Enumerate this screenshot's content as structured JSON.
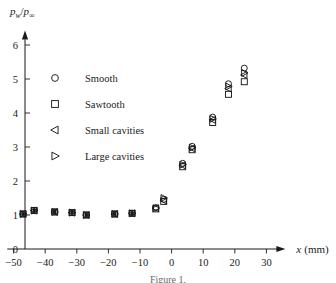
{
  "figure": {
    "caption_fragment": "Figure 1."
  },
  "chart_data": {
    "type": "scatter",
    "title": "",
    "xlabel": "x (mm)",
    "xlabel_symbol": "x",
    "xlabel_unit": "(mm)",
    "ylabel": "pw/p∞",
    "ylabel_symbol": "p",
    "ylabel_sub": "w",
    "ylabel_denom_symbol": "p",
    "ylabel_denom_sub": "∞",
    "xlim": [
      -52,
      36
    ],
    "ylim": [
      0,
      6.4
    ],
    "xticks": [
      -50,
      -40,
      -30,
      -20,
      -10,
      0,
      10,
      20,
      30
    ],
    "xticklabels": [
      "-50",
      "-40",
      "-30",
      "-20",
      "-10",
      "0",
      "10",
      "20",
      "30"
    ],
    "yticks": [
      0,
      1,
      2,
      3,
      4,
      5,
      6
    ],
    "yticklabels": [
      "0",
      "1",
      "2",
      "3",
      "4",
      "5",
      "6"
    ],
    "grid": false,
    "legend_position": "upper-left-inside",
    "series": [
      {
        "name": "Smooth",
        "marker": "circle",
        "points": [
          {
            "x": -47.0,
            "y": 1.03
          },
          {
            "x": -43.5,
            "y": 1.14
          },
          {
            "x": -37.0,
            "y": 1.09
          },
          {
            "x": -31.5,
            "y": 1.07
          },
          {
            "x": -27.0,
            "y": 1.0
          },
          {
            "x": -18.0,
            "y": 1.03
          },
          {
            "x": -12.5,
            "y": 1.05
          },
          {
            "x": -5.0,
            "y": 1.22
          },
          {
            "x": -2.5,
            "y": 1.46
          },
          {
            "x": 3.5,
            "y": 2.52
          },
          {
            "x": 6.5,
            "y": 3.02
          },
          {
            "x": 13.0,
            "y": 3.88
          },
          {
            "x": 18.0,
            "y": 4.86
          },
          {
            "x": 23.0,
            "y": 5.32
          }
        ]
      },
      {
        "name": "Sawtooth",
        "marker": "square",
        "points": [
          {
            "x": -47.0,
            "y": 1.03
          },
          {
            "x": -43.5,
            "y": 1.13
          },
          {
            "x": -37.0,
            "y": 1.09
          },
          {
            "x": -31.5,
            "y": 1.07
          },
          {
            "x": -27.0,
            "y": 1.0
          },
          {
            "x": -18.0,
            "y": 1.03
          },
          {
            "x": -12.5,
            "y": 1.05
          },
          {
            "x": -5.0,
            "y": 1.18
          },
          {
            "x": -2.5,
            "y": 1.4
          },
          {
            "x": 3.5,
            "y": 2.42
          },
          {
            "x": 6.5,
            "y": 2.92
          },
          {
            "x": 13.0,
            "y": 3.72
          },
          {
            "x": 18.0,
            "y": 4.55
          },
          {
            "x": 23.0,
            "y": 4.92
          }
        ]
      },
      {
        "name": "Small cavities",
        "marker": "triangle-left",
        "points": [
          {
            "x": -47.0,
            "y": 1.03
          },
          {
            "x": -43.5,
            "y": 1.13
          },
          {
            "x": -37.0,
            "y": 1.09
          },
          {
            "x": -31.5,
            "y": 1.07
          },
          {
            "x": -27.0,
            "y": 1.0
          },
          {
            "x": -18.0,
            "y": 1.03
          },
          {
            "x": -12.5,
            "y": 1.05
          },
          {
            "x": -5.0,
            "y": 1.2
          },
          {
            "x": -2.5,
            "y": 1.43
          },
          {
            "x": 3.5,
            "y": 2.46
          },
          {
            "x": 6.5,
            "y": 2.96
          },
          {
            "x": 13.0,
            "y": 3.8
          },
          {
            "x": 18.0,
            "y": 4.72
          },
          {
            "x": 23.0,
            "y": 5.12
          }
        ]
      },
      {
        "name": "Large cavities",
        "marker": "triangle-right",
        "points": [
          {
            "x": -47.0,
            "y": 1.03
          },
          {
            "x": -43.5,
            "y": 1.13
          },
          {
            "x": -37.0,
            "y": 1.09
          },
          {
            "x": -31.5,
            "y": 1.07
          },
          {
            "x": -27.0,
            "y": 1.0
          },
          {
            "x": -18.0,
            "y": 1.03
          },
          {
            "x": -12.5,
            "y": 1.05
          },
          {
            "x": -5.0,
            "y": 1.2
          },
          {
            "x": -2.5,
            "y": 1.5
          },
          {
            "x": 3.5,
            "y": 2.48
          },
          {
            "x": 6.5,
            "y": 2.98
          },
          {
            "x": 13.0,
            "y": 3.83
          },
          {
            "x": 18.0,
            "y": 4.78
          },
          {
            "x": 23.0,
            "y": 5.18
          }
        ]
      }
    ],
    "legend": [
      {
        "label": "Smooth",
        "marker": "circle"
      },
      {
        "label": "Sawtooth",
        "marker": "square"
      },
      {
        "label": "Small cavities",
        "marker": "triangle-left"
      },
      {
        "label": "Large cavities",
        "marker": "triangle-right"
      }
    ]
  }
}
